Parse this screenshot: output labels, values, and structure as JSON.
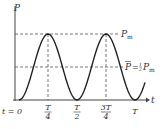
{
  "diagram": {
    "y_axis_label": "P",
    "x_axis_label": "t",
    "peak_label": "P",
    "peak_sub": "m",
    "avg_label_lhs": "P",
    "avg_label_eq": "= ",
    "avg_frac_num": "1",
    "avg_frac_den": "2",
    "avg_label_rhs": "P",
    "avg_rhs_sub": "m",
    "ticks": [
      {
        "label": "t = 0"
      },
      {
        "num": "T",
        "den": "4"
      },
      {
        "num": "T",
        "den": "2"
      },
      {
        "num": "3T",
        "den": "4"
      },
      {
        "label": "T"
      }
    ],
    "colors": {
      "curve": "#222222",
      "axis": "#444444",
      "dashed": "#555555"
    }
  }
}
